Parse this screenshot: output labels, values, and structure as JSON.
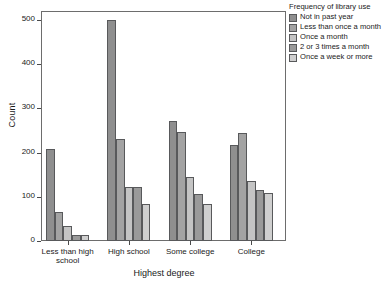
{
  "chart_data": {
    "type": "bar",
    "title": "",
    "xlabel": "Highest degree",
    "ylabel": "Count",
    "categories": [
      "Less than high school",
      "High school",
      "Some college",
      "College"
    ],
    "category_labels_wrapped": [
      [
        "Less than high",
        "school"
      ],
      [
        "High school"
      ],
      [
        "Some college"
      ],
      [
        "College"
      ]
    ],
    "legend_title": "Frequency of library use",
    "legend_position": "right",
    "grid": false,
    "ylim": [
      0,
      520
    ],
    "yticks": [
      0,
      100,
      200,
      300,
      400,
      500
    ],
    "ytick_labels": [
      "0",
      "100",
      "200",
      "300",
      "400",
      "500"
    ],
    "series": [
      {
        "name": "Not in past year",
        "color": "#8f8f8f",
        "values": [
          208,
          500,
          272,
          217
        ]
      },
      {
        "name": "Less than once a month",
        "color": "#a3a3a3",
        "values": [
          65,
          230,
          247,
          245
        ]
      },
      {
        "name": "Once a month",
        "color": "#c4c4c4",
        "values": [
          34,
          123,
          145,
          135
        ]
      },
      {
        "name": "2 or 3 times a month",
        "color": "#9a9a9a",
        "values": [
          14,
          122,
          107,
          116
        ]
      },
      {
        "name": "Once a week or more",
        "color": "#cfcfcf",
        "values": [
          14,
          83,
          83,
          108
        ]
      }
    ],
    "legend_entries": [
      {
        "label": "Not in past year",
        "swatch": "#8f8f8f"
      },
      {
        "label": "Less than once a month",
        "swatch": "#a3a3a3"
      },
      {
        "label": "Once a month",
        "swatch": "#c4c4c4"
      },
      {
        "label": "2 or 3 times a month",
        "swatch": "#9a9a9a"
      },
      {
        "label": "Once a week or more",
        "swatch": "#cfcfcf"
      }
    ]
  }
}
